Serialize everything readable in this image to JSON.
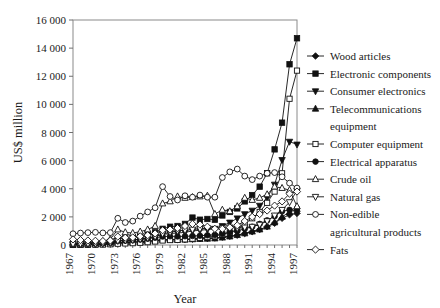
{
  "chart_data": {
    "type": "line",
    "title": "",
    "xlabel": "Year",
    "ylabel": "US$ million",
    "xlim": [
      1967,
      1997
    ],
    "ylim": [
      0,
      16000
    ],
    "ytick_step": 2000,
    "ytick_labels": [
      "0",
      "2 000",
      "4 000",
      "6 000",
      "8 000",
      "10 000",
      "12 000",
      "14 000",
      "16 000"
    ],
    "ytick_values": [
      0,
      2000,
      4000,
      6000,
      8000,
      10000,
      12000,
      14000,
      16000
    ],
    "xtick_labels": [
      "1967",
      "1970",
      "1973",
      "1976",
      "1979",
      "1982",
      "1985",
      "1988",
      "1991",
      "1994",
      "1997"
    ],
    "xtick_values": [
      1967,
      1970,
      1973,
      1976,
      1979,
      1982,
      1985,
      1988,
      1991,
      1994,
      1997
    ],
    "xtick_rotation": -90,
    "grid": false,
    "legend_position": "right",
    "x": [
      1967,
      1968,
      1969,
      1970,
      1971,
      1972,
      1973,
      1974,
      1975,
      1976,
      1977,
      1978,
      1979,
      1980,
      1981,
      1982,
      1983,
      1984,
      1985,
      1986,
      1987,
      1988,
      1989,
      1990,
      1991,
      1992,
      1993,
      1994,
      1995,
      1996,
      1997
    ],
    "series": [
      {
        "name": "Wood articles",
        "marker": "filled-diamond",
        "values": [
          60,
          70,
          80,
          90,
          100,
          120,
          180,
          200,
          210,
          240,
          280,
          320,
          380,
          400,
          390,
          400,
          420,
          450,
          470,
          500,
          560,
          620,
          700,
          820,
          950,
          1100,
          1300,
          1550,
          1900,
          2150,
          2250
        ]
      },
      {
        "name": "Electronic components",
        "marker": "filled-square",
        "values": [
          30,
          40,
          60,
          90,
          140,
          220,
          420,
          470,
          520,
          620,
          760,
          900,
          1150,
          1300,
          1350,
          1500,
          1950,
          1800,
          1850,
          1800,
          2100,
          2350,
          2600,
          3100,
          3550,
          4150,
          5100,
          6800,
          8700,
          12850,
          14700
        ]
      },
      {
        "name": "Consumer electronics",
        "marker": "filled-down-triangle",
        "values": [
          40,
          50,
          70,
          90,
          120,
          160,
          300,
          330,
          360,
          420,
          500,
          600,
          750,
          820,
          850,
          900,
          1000,
          1050,
          1100,
          1150,
          1350,
          1600,
          1900,
          2200,
          2450,
          2800,
          3350,
          4300,
          6050,
          7350,
          7150
        ]
      },
      {
        "name": "Telecommunications equipment",
        "marker": "filled-up-triangle",
        "values": [
          20,
          25,
          30,
          40,
          55,
          80,
          150,
          170,
          190,
          220,
          260,
          300,
          360,
          380,
          370,
          380,
          400,
          420,
          440,
          460,
          520,
          600,
          700,
          820,
          950,
          1100,
          1300,
          1600,
          2000,
          2350,
          2550
        ]
      },
      {
        "name": "Computer equipment",
        "marker": "open-square",
        "values": [
          10,
          12,
          15,
          20,
          30,
          50,
          90,
          110,
          130,
          160,
          200,
          250,
          320,
          350,
          360,
          400,
          450,
          500,
          560,
          620,
          760,
          900,
          1100,
          1500,
          1900,
          2350,
          3000,
          3800,
          5100,
          10400,
          12400
        ]
      },
      {
        "name": "Electrical apparatus",
        "marker": "filled-circle",
        "values": [
          50,
          60,
          70,
          90,
          110,
          150,
          280,
          310,
          340,
          390,
          450,
          520,
          600,
          620,
          610,
          620,
          640,
          660,
          690,
          720,
          800,
          900,
          1000,
          1150,
          1300,
          1500,
          1750,
          2050,
          2400,
          2500,
          2600
        ]
      },
      {
        "name": "Crude oil",
        "marker": "open-up-triangle",
        "values": [
          120,
          140,
          160,
          200,
          260,
          420,
          1100,
          900,
          850,
          950,
          1100,
          1350,
          2950,
          3100,
          3450,
          3350,
          3400,
          3450,
          3500,
          2200,
          2500,
          2400,
          2750,
          3350,
          3200,
          3350,
          3600,
          4150,
          4050,
          3900,
          2750
        ]
      },
      {
        "name": "Natural gas",
        "marker": "open-down-triangle",
        "values": [
          70,
          80,
          90,
          100,
          120,
          160,
          300,
          330,
          360,
          420,
          500,
          600,
          800,
          900,
          1000,
          1050,
          1100,
          1150,
          1200,
          1150,
          1200,
          1250,
          1200,
          1250,
          1300,
          1450,
          1700,
          2100,
          2500,
          3050,
          3850
        ]
      },
      {
        "name": "Non-edible agricultural products",
        "marker": "open-circle",
        "values": [
          800,
          850,
          880,
          900,
          860,
          880,
          1900,
          1600,
          1700,
          2050,
          2350,
          2650,
          4150,
          3450,
          3200,
          3500,
          3400,
          3550,
          3400,
          3400,
          4800,
          5200,
          5400,
          4900,
          4650,
          4900,
          5100,
          5150,
          4850,
          4400,
          4050
        ]
      },
      {
        "name": "Fats",
        "marker": "open-diamond",
        "values": [
          400,
          350,
          320,
          300,
          280,
          320,
          600,
          520,
          540,
          620,
          700,
          820,
          1050,
          1100,
          1200,
          1350,
          1500,
          1450,
          1300,
          1150,
          1150,
          1250,
          1400,
          1700,
          2000,
          2200,
          2450,
          2800,
          3100,
          3650,
          3800
        ]
      }
    ]
  },
  "legend": {
    "items": [
      {
        "label": "Wood articles"
      },
      {
        "label": "Electronic components"
      },
      {
        "label": "Consumer electronics"
      },
      {
        "label": "Telecommunications"
      },
      {
        "label": "equipment"
      },
      {
        "label": "Computer equipment"
      },
      {
        "label": "Electrical apparatus"
      },
      {
        "label": "Crude oil"
      },
      {
        "label": "Natural gas"
      },
      {
        "label": "Non-edible"
      },
      {
        "label": "agricultural products"
      },
      {
        "label": "Fats"
      }
    ]
  },
  "colors": {
    "ink": "#111111",
    "frame": "#8a8a8a",
    "background": "#ffffff"
  }
}
